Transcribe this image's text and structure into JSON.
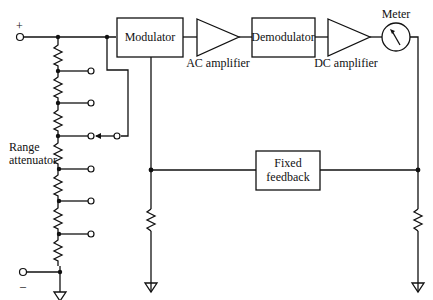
{
  "diagram": {
    "type": "block-circuit",
    "terminals": {
      "positive": "+",
      "negative": "–"
    },
    "blocks": {
      "modulator": "Modulator",
      "ac_amplifier": "AC amplifier",
      "demodulator": "Demodulator",
      "dc_amplifier": "DC amplifier",
      "meter": "Meter",
      "fixed_feedback_line1": "Fixed",
      "fixed_feedback_line2": "feedback"
    },
    "range_attenuator": {
      "line1": "Range",
      "line2": "attenuator",
      "resistor_count": 8,
      "tap_count": 7
    },
    "icons": [
      "resistor-icon",
      "ground-icon",
      "amplifier-triangle-icon",
      "meter-icon",
      "terminal-icon",
      "switch-arrow-icon"
    ]
  }
}
